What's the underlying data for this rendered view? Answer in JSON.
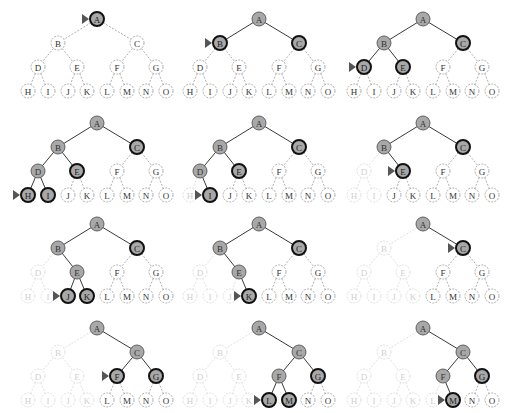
{
  "colors": {
    "background": "#ffffff",
    "explored_fill": "#a8a8a8",
    "frontier_fill": "#a8a8a8",
    "unexplored_fill": "#ffffff",
    "solid_edge": "#3a3a3a",
    "dashed_edge": "#9a9a9a",
    "faded": "#d8d8d8",
    "pointer": "#555555"
  },
  "legend_states": {
    "explored": "filled grey, solid edge",
    "frontier": "filled grey, thick black border",
    "unexplored": "white, dashed border",
    "discarded": "faded dotted",
    "current": "triangle pointer"
  },
  "tree": {
    "nodes": [
      "A",
      "B",
      "C",
      "D",
      "E",
      "F",
      "G",
      "H",
      "I",
      "J",
      "K",
      "L",
      "M",
      "N",
      "O"
    ],
    "edges": [
      [
        "A",
        "B"
      ],
      [
        "A",
        "C"
      ],
      [
        "B",
        "D"
      ],
      [
        "B",
        "E"
      ],
      [
        "C",
        "F"
      ],
      [
        "C",
        "G"
      ],
      [
        "D",
        "H"
      ],
      [
        "D",
        "I"
      ],
      [
        "E",
        "J"
      ],
      [
        "E",
        "K"
      ],
      [
        "F",
        "L"
      ],
      [
        "F",
        "M"
      ],
      [
        "G",
        "N"
      ],
      [
        "G",
        "O"
      ]
    ]
  },
  "panels": [
    {
      "step": 1,
      "current": "A",
      "explored": [],
      "frontier": [
        "A"
      ],
      "discarded": []
    },
    {
      "step": 2,
      "current": "B",
      "explored": [
        "A"
      ],
      "frontier": [
        "B",
        "C"
      ],
      "discarded": []
    },
    {
      "step": 3,
      "current": "D",
      "explored": [
        "A",
        "B"
      ],
      "frontier": [
        "C",
        "D",
        "E"
      ],
      "discarded": []
    },
    {
      "step": 4,
      "current": "H",
      "explored": [
        "A",
        "B",
        "D"
      ],
      "frontier": [
        "C",
        "E",
        "H",
        "I"
      ],
      "discarded": []
    },
    {
      "step": 5,
      "current": "I",
      "explored": [
        "A",
        "B",
        "D"
      ],
      "frontier": [
        "C",
        "E",
        "I"
      ],
      "discarded": [
        "H"
      ]
    },
    {
      "step": 6,
      "current": "E",
      "explored": [
        "A",
        "B"
      ],
      "frontier": [
        "C",
        "E"
      ],
      "discarded": [
        "D",
        "H",
        "I"
      ]
    },
    {
      "step": 7,
      "current": "J",
      "explored": [
        "A",
        "B",
        "E"
      ],
      "frontier": [
        "C",
        "J",
        "K"
      ],
      "discarded": [
        "D",
        "H",
        "I"
      ]
    },
    {
      "step": 8,
      "current": "K",
      "explored": [
        "A",
        "B",
        "E"
      ],
      "frontier": [
        "C",
        "K"
      ],
      "discarded": [
        "D",
        "H",
        "I",
        "J"
      ]
    },
    {
      "step": 9,
      "current": "C",
      "explored": [
        "A"
      ],
      "frontier": [
        "C"
      ],
      "discarded": [
        "B",
        "D",
        "E",
        "H",
        "I",
        "J",
        "K"
      ]
    },
    {
      "step": 10,
      "current": "F",
      "explored": [
        "A",
        "C"
      ],
      "frontier": [
        "F",
        "G"
      ],
      "discarded": [
        "B",
        "D",
        "E",
        "H",
        "I",
        "J",
        "K"
      ]
    },
    {
      "step": 11,
      "current": "L",
      "explored": [
        "A",
        "C",
        "F"
      ],
      "frontier": [
        "G",
        "L",
        "M"
      ],
      "discarded": [
        "B",
        "D",
        "E",
        "H",
        "I",
        "J",
        "K"
      ]
    },
    {
      "step": 12,
      "current": "M",
      "explored": [
        "A",
        "C",
        "F"
      ],
      "frontier": [
        "G",
        "M"
      ],
      "discarded": [
        "B",
        "D",
        "E",
        "H",
        "I",
        "J",
        "K",
        "L"
      ]
    }
  ]
}
